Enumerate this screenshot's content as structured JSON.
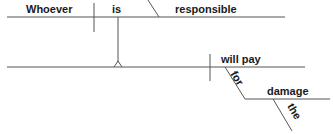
{
  "diagram": {
    "type": "sentence-diagram",
    "sentence": "Whoever is responsible will pay for the damage",
    "clause": {
      "subject": "Whoever",
      "verb": "is",
      "predicate_adjective": "responsible"
    },
    "main": {
      "verb": "will pay",
      "preposition": "for",
      "object_of_preposition": "damage",
      "article": "the"
    },
    "colors": {
      "line": "#555555",
      "text": "#1a1a1a",
      "background": "#ffffff"
    }
  }
}
